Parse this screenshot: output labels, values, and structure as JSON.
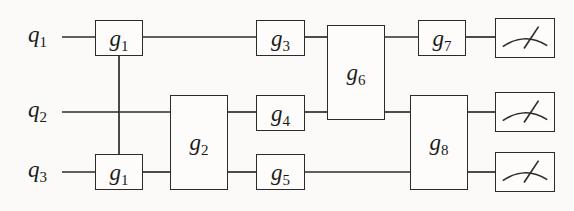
{
  "figure": {
    "kind": "quantum-circuit-diagram",
    "background_color": "#fbfaf8",
    "line_color": "#2b2b2b",
    "text_color": "#1a1a1a"
  },
  "qubits": [
    {
      "id": "q1",
      "base": "q",
      "index": "1",
      "wire_y": 37
    },
    {
      "id": "q2",
      "base": "q",
      "index": "2",
      "wire_y": 112
    },
    {
      "id": "q3",
      "base": "q",
      "index": "3",
      "wire_y": 172
    }
  ],
  "gates": [
    {
      "id": "g1a",
      "base": "g",
      "index": "1",
      "x": 95,
      "y": 20,
      "w": 48,
      "h": 36,
      "qubits": [
        "q1"
      ]
    },
    {
      "id": "g1b",
      "base": "g",
      "index": "1",
      "x": 95,
      "y": 154,
      "w": 48,
      "h": 36,
      "qubits": [
        "q3"
      ]
    },
    {
      "id": "g2",
      "base": "g",
      "index": "2",
      "x": 170,
      "y": 95,
      "w": 58,
      "h": 95,
      "qubits": [
        "q2",
        "q3"
      ]
    },
    {
      "id": "g3",
      "base": "g",
      "index": "3",
      "x": 256,
      "y": 20,
      "w": 49,
      "h": 36,
      "qubits": [
        "q1"
      ]
    },
    {
      "id": "g4",
      "base": "g",
      "index": "4",
      "x": 256,
      "y": 95,
      "w": 49,
      "h": 36,
      "qubits": [
        "q2"
      ]
    },
    {
      "id": "g5",
      "base": "g",
      "index": "5",
      "x": 256,
      "y": 154,
      "w": 49,
      "h": 36,
      "qubits": [
        "q3"
      ]
    },
    {
      "id": "g6",
      "base": "g",
      "index": "6",
      "x": 327,
      "y": 25,
      "w": 58,
      "h": 95,
      "qubits": [
        "q1",
        "q2"
      ]
    },
    {
      "id": "g7",
      "base": "g",
      "index": "7",
      "x": 418,
      "y": 20,
      "w": 48,
      "h": 36,
      "qubits": [
        "q1"
      ]
    },
    {
      "id": "g8",
      "base": "g",
      "index": "8",
      "x": 410,
      "y": 95,
      "w": 58,
      "h": 95,
      "qubits": [
        "q2",
        "q3"
      ]
    }
  ],
  "controlled_links": [
    {
      "id": "link-g1",
      "x": 119,
      "y_from": 56,
      "y_to": 154
    }
  ],
  "meters": [
    {
      "id": "meter-q1",
      "x": 495,
      "y": 18,
      "w": 60,
      "h": 40,
      "qubit": "q1"
    },
    {
      "id": "meter-q2",
      "x": 495,
      "y": 92,
      "w": 60,
      "h": 40,
      "qubit": "q2"
    },
    {
      "id": "meter-q3",
      "x": 495,
      "y": 152,
      "w": 60,
      "h": 40,
      "qubit": "q3"
    }
  ],
  "wires": [
    {
      "id": "wire-q1-0",
      "x1": 62,
      "y": 37,
      "x2": 95
    },
    {
      "id": "wire-q1-1",
      "x1": 143,
      "y": 37,
      "x2": 256
    },
    {
      "id": "wire-q1-2",
      "x1": 305,
      "y": 37,
      "x2": 327
    },
    {
      "id": "wire-q1-3",
      "x1": 385,
      "y": 37,
      "x2": 418
    },
    {
      "id": "wire-q1-4",
      "x1": 466,
      "y": 37,
      "x2": 495
    },
    {
      "id": "wire-q2-0",
      "x1": 62,
      "y": 112,
      "x2": 170
    },
    {
      "id": "wire-q2-1",
      "x1": 228,
      "y": 112,
      "x2": 256
    },
    {
      "id": "wire-q2-2",
      "x1": 305,
      "y": 112,
      "x2": 327
    },
    {
      "id": "wire-q2-3",
      "x1": 385,
      "y": 112,
      "x2": 410
    },
    {
      "id": "wire-q2-4",
      "x1": 468,
      "y": 112,
      "x2": 495
    },
    {
      "id": "wire-q3-0",
      "x1": 62,
      "y": 172,
      "x2": 95
    },
    {
      "id": "wire-q3-1",
      "x1": 143,
      "y": 172,
      "x2": 170
    },
    {
      "id": "wire-q3-2",
      "x1": 228,
      "y": 172,
      "x2": 256
    },
    {
      "id": "wire-q3-3",
      "x1": 305,
      "y": 172,
      "x2": 410
    },
    {
      "id": "wire-q3-4",
      "x1": 468,
      "y": 172,
      "x2": 495
    }
  ],
  "label_positions": [
    {
      "id": "q1",
      "x": 28,
      "y": 22
    },
    {
      "id": "q2",
      "x": 28,
      "y": 97
    },
    {
      "id": "q3",
      "x": 28,
      "y": 157
    }
  ]
}
